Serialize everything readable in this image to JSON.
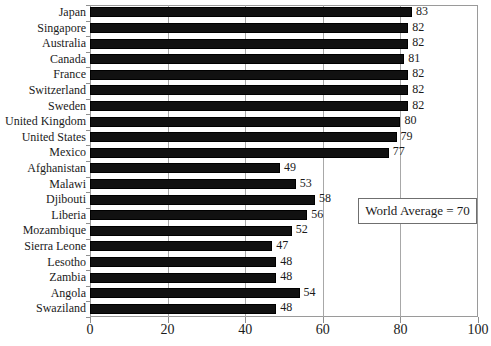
{
  "chart_data": {
    "type": "bar",
    "orientation": "horizontal",
    "title": "",
    "xlabel": "",
    "ylabel": "",
    "xlim": [
      0,
      100
    ],
    "xticks": [
      0,
      20,
      40,
      60,
      80,
      100
    ],
    "grid": true,
    "legend": null,
    "categories": [
      "Japan",
      "Singapore",
      "Australia",
      "Canada",
      "France",
      "Switzerland",
      "Sweden",
      "United Kingdom",
      "United States",
      "Mexico",
      "Afghanistan",
      "Malawi",
      "Djibouti",
      "Liberia",
      "Mozambique",
      "Sierra Leone",
      "Lesotho",
      "Zambia",
      "Angola",
      "Swaziland"
    ],
    "values": [
      83,
      82,
      82,
      81,
      82,
      82,
      82,
      80,
      79,
      77,
      49,
      53,
      58,
      56,
      52,
      47,
      48,
      48,
      54,
      48
    ],
    "annotations": [
      {
        "text": "World Average = 70",
        "value": 70
      }
    ],
    "colors": {
      "bar": "#111111",
      "bar_edge": "#000000",
      "grid": "#a8a8a8",
      "axis": "#9a9a9a",
      "text": "#1a1a1a",
      "background": "#ffffff"
    }
  },
  "annotation": {
    "label": "World Average = 70"
  }
}
